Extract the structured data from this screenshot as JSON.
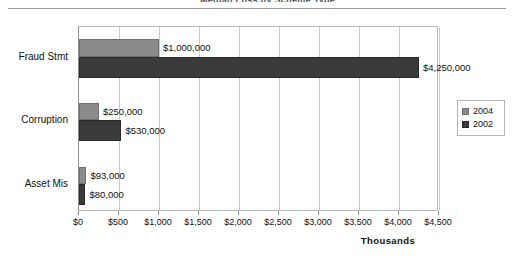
{
  "header": {
    "title_remnant": "Median Loss by Scheme Type"
  },
  "legend": {
    "position": "right-middle",
    "entries": [
      {
        "label": "2004",
        "color": "#8b8b8b"
      },
      {
        "label": "2002",
        "color": "#3b3b3b"
      }
    ]
  },
  "axis": {
    "title": "Thousands",
    "tick_labels": [
      "$0",
      "$500",
      "$1,000",
      "$1,500",
      "$2,000",
      "$2,500",
      "$3,000",
      "$3,500",
      "$4,000",
      "$4,500"
    ],
    "tick_values": [
      0,
      500,
      1000,
      1500,
      2000,
      2500,
      3000,
      3500,
      4000,
      4500
    ]
  },
  "chart_data": {
    "type": "bar",
    "orientation": "horizontal",
    "title": "Median Loss by Scheme Type",
    "xlabel": "Thousands",
    "ylabel": "",
    "xlim": [
      0,
      4500
    ],
    "grid": true,
    "legend_position": "right",
    "categories": [
      "Fraud Stmt",
      "Corruption",
      "Asset Mis"
    ],
    "series": [
      {
        "name": "2004",
        "color": "#8b8b8b",
        "values": [
          1000,
          250,
          93
        ],
        "data_labels": [
          "$1,000,000",
          "$250,000",
          "$93,000"
        ]
      },
      {
        "name": "2002",
        "color": "#3b3b3b",
        "values": [
          4250,
          530,
          80
        ],
        "data_labels": [
          "$4,250,000",
          "$530,000",
          "$80,000"
        ]
      }
    ],
    "units_note": "values plotted in thousands of dollars"
  },
  "bars": [
    {
      "category": "Fraud Stmt",
      "series": "2004",
      "value": 1000,
      "label": "$1,000,000",
      "top": 12,
      "height": 18
    },
    {
      "category": "Fraud Stmt",
      "series": "2002",
      "value": 4250,
      "label": "$4,250,000",
      "top": 30,
      "height": 21
    },
    {
      "category": "Corruption",
      "series": "2004",
      "value": 250,
      "label": "$250,000",
      "top": 76,
      "height": 17
    },
    {
      "category": "Corruption",
      "series": "2002",
      "value": 530,
      "label": "$530,000",
      "top": 93,
      "height": 21
    },
    {
      "category": "Asset Mis",
      "series": "2004",
      "value": 93,
      "label": "$93,000",
      "top": 140,
      "height": 17
    },
    {
      "category": "Asset Mis",
      "series": "2002",
      "value": 80,
      "label": "$80,000",
      "top": 157,
      "height": 21
    }
  ]
}
